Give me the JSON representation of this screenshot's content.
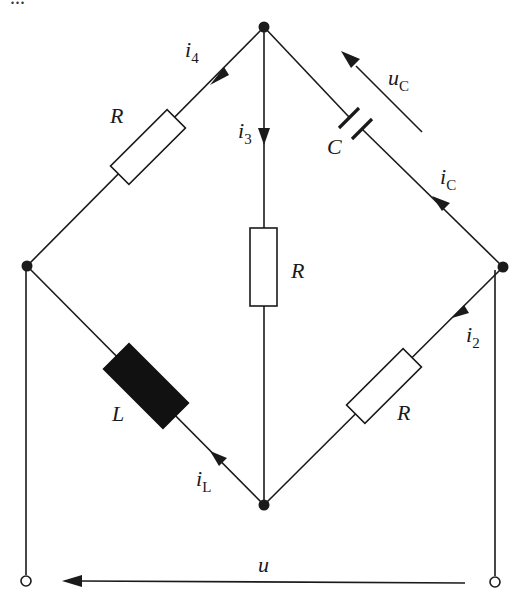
{
  "diagram": {
    "type": "circuit-bridge",
    "top_caption_cropped": "...",
    "nodes": {
      "top": {
        "x": 264,
        "y": 27
      },
      "left": {
        "x": 27,
        "y": 266
      },
      "right": {
        "x": 503,
        "y": 267
      },
      "bottom": {
        "x": 264,
        "y": 505
      }
    },
    "terminals": {
      "left": {
        "x": 26,
        "y": 581
      },
      "right": {
        "x": 495,
        "y": 582
      }
    },
    "components": {
      "r_top_left": {
        "type": "resistor",
        "label": "R"
      },
      "r_center": {
        "type": "resistor",
        "label": "R"
      },
      "capacitor": {
        "type": "capacitor",
        "label": "C"
      },
      "inductor": {
        "type": "inductor",
        "label": "L"
      },
      "r_bottom_right": {
        "type": "resistor",
        "label": "R"
      }
    },
    "currents": {
      "i4": {
        "base": "i",
        "sub": "4"
      },
      "i3": {
        "base": "i",
        "sub": "3"
      },
      "iC": {
        "base": "i",
        "sub": "C"
      },
      "i2": {
        "base": "i",
        "sub": "2"
      },
      "iL": {
        "base": "i",
        "sub": "L"
      }
    },
    "voltages": {
      "uC": {
        "base": "u",
        "sub": "C"
      },
      "u": {
        "base": "u"
      }
    },
    "colors": {
      "line": "#1a1a1a",
      "background": "#ffffff",
      "inductor_fill": "#111111"
    }
  }
}
